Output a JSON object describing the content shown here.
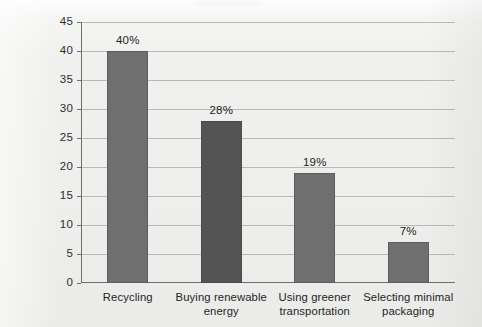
{
  "chart_data": {
    "type": "bar",
    "title": "",
    "subtitle": "",
    "xlabel": "",
    "ylabel": "Percent",
    "ylim": [
      0,
      45
    ],
    "ytick_step": 5,
    "yticks": [
      "0",
      "5",
      "10",
      "15",
      "20",
      "25",
      "30",
      "35",
      "40",
      "45"
    ],
    "grid": "horizontal",
    "legend": "none",
    "categories": [
      "Recycling",
      "Buying renewable energy",
      "Using greener transportation",
      "Selecting minimal packaging"
    ],
    "category_lines": [
      [
        "Recycling"
      ],
      [
        "Buying renewable",
        "energy"
      ],
      [
        "Using greener",
        "transportation"
      ],
      [
        "Selecting minimal",
        "packaging"
      ]
    ],
    "values": [
      40,
      28,
      19,
      7
    ],
    "value_labels": [
      "40%",
      "28%",
      "19%",
      "7%"
    ],
    "bar_colors": [
      "#6f6f6f",
      "#545454",
      "#6f6f6f",
      "#6f6f6f"
    ],
    "plot_background": "#f0f0ee",
    "gridline_color": "#b9b9b7",
    "axis_color": "#6f6f6f"
  }
}
